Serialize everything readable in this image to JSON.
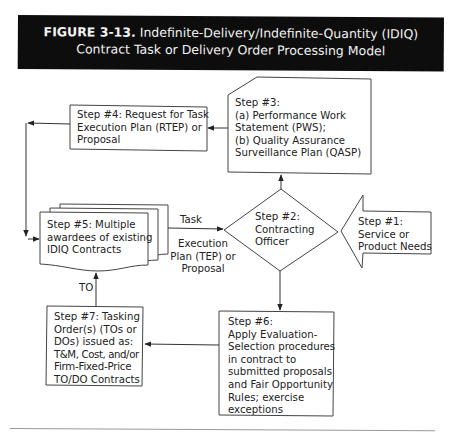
{
  "figure": {
    "number_label": "FIGURE 3-13.",
    "title_line1": "Indefinite-Delivery/Indefinite-Quantity (IDIQ)",
    "title_line2": "Contract Task or Delivery Order Processing Model",
    "banner_color": "#0d0d0d",
    "banner_text_color": "#f2f2f2"
  },
  "nodes": {
    "step1": {
      "shape": "left-arrow",
      "lines": [
        "Step #1:",
        "Service or",
        "Product Needs"
      ]
    },
    "step2": {
      "shape": "diamond",
      "lines": [
        "Step #2:",
        "Contracting",
        "Officer"
      ]
    },
    "step3": {
      "shape": "card-cut-corner",
      "lines": [
        "Step #3:",
        "(a) Performance Work",
        "Statement (PWS);",
        "(b) Quality Assurance",
        "Surveillance Plan (QASP)"
      ]
    },
    "step4": {
      "shape": "rectangle",
      "lines": [
        "Step #4: Request for Task",
        "Execution Plan (RTEP) or",
        "Proposal"
      ]
    },
    "step5": {
      "shape": "multi-document",
      "lines": [
        "Step #5: Multiple",
        "awardees of existing",
        "IDIQ Contracts"
      ]
    },
    "step6": {
      "shape": "rectangle",
      "lines": [
        "Step #6:",
        "Apply Evaluation-",
        "Selection procedures",
        "in contract to",
        "submitted proposals",
        "and Fair Opportunity",
        "Rules; exercise",
        "exceptions"
      ]
    },
    "step7": {
      "shape": "rectangle",
      "lines": [
        "Step #7: Tasking",
        "Order(s) (TOs or",
        "DOs) issued as:",
        "T&M, Cost, and/or",
        "Firm-Fixed-Price",
        "TO/DO Contracts"
      ]
    }
  },
  "edges": [
    {
      "from": "step1",
      "to": "step2",
      "label": ""
    },
    {
      "from": "step2",
      "to": "step3",
      "label": ""
    },
    {
      "from": "step3",
      "to": "step4",
      "label": ""
    },
    {
      "from": "step4",
      "to": "step5",
      "label": ""
    },
    {
      "from": "step5",
      "to": "step2",
      "label_top": "Task",
      "label_bottom": [
        "Execution",
        "Plan (TEP) or",
        "Proposal"
      ]
    },
    {
      "from": "step2",
      "to": "step6",
      "label": ""
    },
    {
      "from": "step6",
      "to": "step7",
      "label": ""
    },
    {
      "from": "step7",
      "to": "step5",
      "label": "TO"
    }
  ],
  "line_color": "#333333"
}
